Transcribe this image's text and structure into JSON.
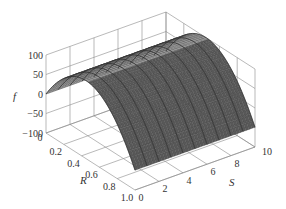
{
  "chart_data": {
    "type": "surface3d",
    "title": "",
    "xlabel": "R",
    "ylabel": "S",
    "zlabel": "f",
    "x_ticks": [
      "0",
      "0.2",
      "0.4",
      "0.6",
      "0.8",
      "1.0"
    ],
    "y_ticks": [
      "0",
      "2",
      "4",
      "6",
      "8",
      "10"
    ],
    "z_ticks": [
      "-100",
      "-50",
      "0",
      "50",
      "100"
    ],
    "xlim": [
      0,
      1
    ],
    "ylim": [
      0,
      10
    ],
    "zlim": [
      -100,
      100
    ],
    "grid": true,
    "surface": {
      "description": "Parabolic ridge in R, nearly constant along S",
      "R_samples": [
        0,
        0.1,
        0.2,
        0.3,
        0.4,
        0.5,
        0.6,
        0.7,
        0.8,
        0.9,
        1.0
      ],
      "f_at_R": [
        0,
        40,
        70,
        89,
        99,
        99,
        89,
        70,
        40,
        0,
        -49
      ],
      "S_samples": [
        0,
        2,
        4,
        6,
        8,
        10
      ],
      "colors": {
        "front_face": "#9a9a9a",
        "back_face": "#585858",
        "mesh_line": "#2a2a2a"
      }
    }
  },
  "axes": {
    "z_label": "f",
    "x_label": "R",
    "y_label": "S"
  }
}
